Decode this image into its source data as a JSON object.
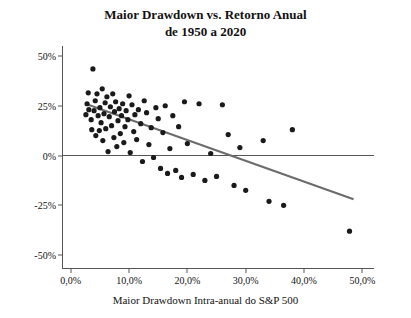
{
  "chart_data": {
    "type": "scatter",
    "title": "Maior Drawdown vs. Retorno Anual",
    "subtitle": "de 1950 a 2020",
    "xlabel": "Maior Drawdown Intra-anual do S&P 500",
    "ylabel": "Retorno Anual de Ações",
    "xlim": [
      -1.5,
      52
    ],
    "ylim": [
      -57,
      55
    ],
    "xticks": [
      0,
      10,
      20,
      30,
      40,
      50
    ],
    "xticklabels": [
      "0,0%",
      "10,0%",
      "20,0%",
      "30,0%",
      "40,0%",
      "50,0%"
    ],
    "yticks": [
      -50,
      -25,
      0,
      25,
      50
    ],
    "yticklabels": [
      "-50%",
      "-25%",
      "0%",
      "25%",
      "50%"
    ],
    "grid": false,
    "legend": null,
    "zero_line": {
      "y": 0,
      "color": "#555555"
    },
    "trendline": {
      "color": "#6b6b6b",
      "x0": 3.0,
      "y0": 25.5,
      "x1": 48.5,
      "y1": -22.0
    },
    "point_color": "#1a1a1a",
    "points": [
      [
        2.6,
        20.5
      ],
      [
        2.8,
        26.0
      ],
      [
        3.0,
        31.5
      ],
      [
        3.1,
        23.0
      ],
      [
        3.5,
        18.0
      ],
      [
        3.6,
        13.0
      ],
      [
        3.8,
        43.5
      ],
      [
        4.0,
        22.5
      ],
      [
        4.2,
        27.5
      ],
      [
        4.3,
        10.0
      ],
      [
        4.5,
        31.0
      ],
      [
        4.7,
        20.0
      ],
      [
        4.9,
        12.5
      ],
      [
        5.0,
        24.0
      ],
      [
        5.2,
        16.5
      ],
      [
        5.4,
        33.5
      ],
      [
        5.5,
        7.5
      ],
      [
        5.7,
        21.0
      ],
      [
        5.9,
        26.5
      ],
      [
        6.0,
        13.5
      ],
      [
        6.2,
        29.5
      ],
      [
        6.4,
        2.0
      ],
      [
        6.6,
        19.5
      ],
      [
        6.8,
        24.5
      ],
      [
        7.0,
        15.0
      ],
      [
        7.2,
        31.0
      ],
      [
        7.4,
        9.0
      ],
      [
        7.5,
        22.0
      ],
      [
        7.7,
        27.0
      ],
      [
        7.9,
        4.5
      ],
      [
        8.1,
        17.5
      ],
      [
        8.3,
        23.5
      ],
      [
        8.5,
        11.0
      ],
      [
        8.7,
        20.0
      ],
      [
        8.9,
        26.0
      ],
      [
        9.1,
        6.5
      ],
      [
        9.3,
        14.5
      ],
      [
        9.5,
        22.5
      ],
      [
        9.8,
        18.0
      ],
      [
        10.0,
        30.0
      ],
      [
        10.2,
        1.5
      ],
      [
        10.5,
        25.5
      ],
      [
        10.8,
        12.0
      ],
      [
        11.0,
        20.5
      ],
      [
        11.3,
        8.0
      ],
      [
        11.6,
        23.0
      ],
      [
        12.0,
        16.0
      ],
      [
        12.3,
        -3.0
      ],
      [
        12.6,
        27.5
      ],
      [
        13.0,
        21.5
      ],
      [
        13.4,
        5.5
      ],
      [
        13.8,
        14.0
      ],
      [
        14.2,
        -1.0
      ],
      [
        14.6,
        24.0
      ],
      [
        15.0,
        18.5
      ],
      [
        15.4,
        -6.5
      ],
      [
        15.8,
        11.5
      ],
      [
        16.2,
        25.0
      ],
      [
        16.6,
        -9.0
      ],
      [
        17.0,
        3.5
      ],
      [
        17.5,
        20.0
      ],
      [
        18.0,
        -7.5
      ],
      [
        18.5,
        14.5
      ],
      [
        19.0,
        -11.0
      ],
      [
        19.5,
        27.0
      ],
      [
        20.0,
        6.0
      ],
      [
        21.0,
        -9.5
      ],
      [
        22.0,
        26.0
      ],
      [
        23.0,
        -12.5
      ],
      [
        24.0,
        1.0
      ],
      [
        25.0,
        -10.5
      ],
      [
        26.0,
        25.5
      ],
      [
        27.0,
        10.5
      ],
      [
        28.0,
        -15.0
      ],
      [
        29.0,
        4.0
      ],
      [
        30.0,
        -17.5
      ],
      [
        33.0,
        7.5
      ],
      [
        34.0,
        -23.0
      ],
      [
        36.5,
        -25.0
      ],
      [
        38.0,
        13.0
      ],
      [
        47.8,
        -38.0
      ]
    ]
  }
}
